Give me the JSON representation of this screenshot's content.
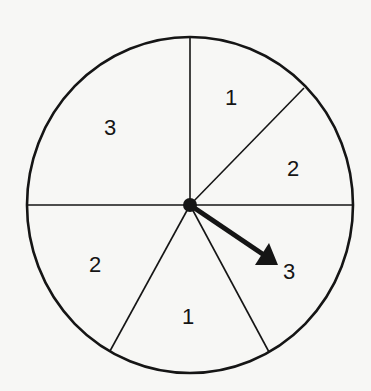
{
  "diagram": {
    "type": "spinner",
    "center": [
      190,
      205
    ],
    "radius_x": 163,
    "radius_y": 168,
    "colors": {
      "stroke": "#151515",
      "background": "#f7f7f5"
    },
    "spokes": [
      {
        "to": [
          190,
          37
        ]
      },
      {
        "to": [
          304,
          88
        ]
      },
      {
        "to": [
          353,
          205
        ]
      },
      {
        "to": [
          269,
          352
        ]
      },
      {
        "to": [
          110,
          351
        ]
      },
      {
        "to": [
          27,
          205
        ]
      }
    ],
    "sectors": [
      {
        "label": "1",
        "pos": [
          231,
          105
        ]
      },
      {
        "label": "2",
        "pos": [
          293,
          176
        ]
      },
      {
        "label": "3",
        "pos": [
          289,
          279
        ]
      },
      {
        "label": "1",
        "pos": [
          188,
          324
        ]
      },
      {
        "label": "2",
        "pos": [
          95,
          272
        ]
      },
      {
        "label": "3",
        "pos": [
          110,
          135
        ]
      }
    ],
    "arrow": {
      "from": [
        190,
        205
      ],
      "to": [
        278,
        265
      ],
      "points_to": "3"
    }
  }
}
